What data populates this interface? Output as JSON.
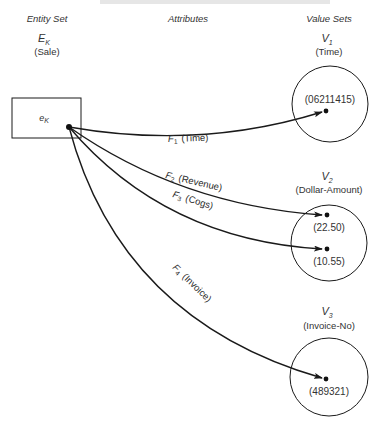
{
  "caption": {
    "text": "Figure — Attribute mappings of an entity set Sale",
    "visible": "cut off at top"
  },
  "headers": {
    "entity_set": "Entity Set",
    "attributes": "Attributes",
    "value_sets": "Value Sets"
  },
  "entity_set": {
    "symbol": "E",
    "symbol_sub": "K",
    "name": "(Sale)",
    "entity": {
      "symbol": "e",
      "symbol_sub": "K"
    }
  },
  "attributes": [
    {
      "symbol": "F",
      "sub": "1",
      "name": "(Time)",
      "target": "V1.values.0"
    },
    {
      "symbol": "F",
      "sub": "2",
      "name": "(Revenue)",
      "target": "V2.values.0"
    },
    {
      "symbol": "F",
      "sub": "3",
      "name": "(Cogs)",
      "target": "V2.values.1"
    },
    {
      "symbol": "F",
      "sub": "4",
      "name": "(Invoice)",
      "target": "V3.values.0"
    }
  ],
  "value_sets": [
    {
      "symbol": "V",
      "sub": "1",
      "name": "(Time)",
      "values": [
        "(06211415)"
      ]
    },
    {
      "symbol": "V",
      "sub": "2",
      "name": "(Dollar-Amount)",
      "values": [
        "(22.50)",
        "(10.55)"
      ]
    },
    {
      "symbol": "V",
      "sub": "3",
      "name": "(Invoice-No)",
      "values": [
        "(489321)"
      ]
    }
  ],
  "colors": {
    "line": "#1a1a1a",
    "text": "#333333",
    "background": "#ffffff"
  }
}
